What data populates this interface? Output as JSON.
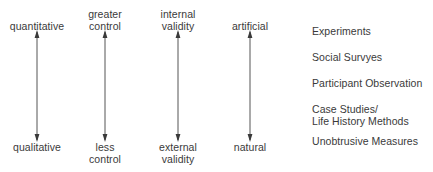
{
  "diagram": {
    "type": "continuum-axes-with-method-list",
    "background_color": "#ffffff",
    "text_color": "#3a3a3a",
    "arrow_color": "#555555",
    "axes": [
      {
        "id": "quantitative-qualitative",
        "x": 37,
        "top_label": "quantitative",
        "bottom_label": "qualitative"
      },
      {
        "id": "control",
        "x": 105,
        "top_label": "greater\ncontrol",
        "bottom_label": "less\ncontrol"
      },
      {
        "id": "validity",
        "x": 178,
        "top_label": "internal\nvalidity",
        "bottom_label": "external\nvalidity"
      },
      {
        "id": "artificial-natural",
        "x": 250,
        "top_label": "artificial",
        "bottom_label": "natural"
      }
    ],
    "methods": [
      {
        "label": "Experiments",
        "y": 26
      },
      {
        "label": "Social Survyes",
        "y": 52
      },
      {
        "label": "Participant Observation",
        "y": 78
      },
      {
        "label": "Case Studies/\nLife History Methods",
        "y": 104
      },
      {
        "label": "Unobtrusive Measures",
        "y": 136
      }
    ]
  }
}
